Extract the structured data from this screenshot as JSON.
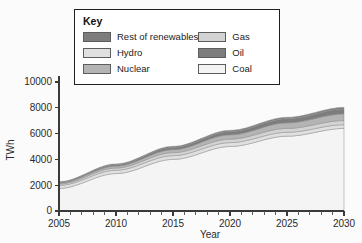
{
  "legend": {
    "title": "Key",
    "left_items": [
      {
        "label": "Rest of renewables",
        "color": "#7d7d7d",
        "swatch_name": "legend-swatch-rest-of-renewables"
      },
      {
        "label": "Hydro",
        "color": "#e0e0e0",
        "swatch_name": "legend-swatch-hydro"
      },
      {
        "label": "Nuclear",
        "color": "#b4b4b4",
        "swatch_name": "legend-swatch-nuclear"
      }
    ],
    "right_items": [
      {
        "label": "Gas",
        "color": "#d3d3d3",
        "swatch_name": "legend-swatch-gas"
      },
      {
        "label": "Oil",
        "color": "#7d7d7d",
        "swatch_name": "legend-swatch-oil"
      },
      {
        "label": "Coal",
        "color": "#f4f4f4",
        "swatch_name": "legend-swatch-coal"
      }
    ]
  },
  "chart_data": {
    "type": "area",
    "title": "",
    "xlabel": "Year",
    "ylabel": "TWh",
    "xlim": [
      2005,
      2030
    ],
    "ylim": [
      0,
      10000
    ],
    "x_ticks": [
      2005,
      2010,
      2015,
      2020,
      2025,
      2030
    ],
    "y_ticks": [
      0,
      2000,
      4000,
      6000,
      8000,
      10000
    ],
    "x_minor_step": 1,
    "grid": false,
    "legend_position": "top-center",
    "stacked": true,
    "x": [
      2005,
      2010,
      2015,
      2020,
      2025,
      2030
    ],
    "series": [
      {
        "name": "Coal",
        "color": "#f4f4f4",
        "values": [
          1750,
          2900,
          4000,
          5000,
          5800,
          6400
        ]
      },
      {
        "name": "Hydro",
        "color": "#e0e0e0",
        "values": [
          230,
          260,
          290,
          300,
          300,
          290
        ]
      },
      {
        "name": "Gas",
        "color": "#d3d3d3",
        "values": [
          110,
          170,
          230,
          270,
          300,
          320
        ]
      },
      {
        "name": "Nuclear",
        "color": "#b4b4b4",
        "values": [
          80,
          150,
          230,
          330,
          430,
          510
        ]
      },
      {
        "name": "Rest of renewables",
        "color": "#7d7d7d",
        "values": [
          60,
          110,
          180,
          250,
          320,
          390
        ]
      },
      {
        "name": "Oil",
        "color": "#7d7d7d",
        "values": [
          40,
          60,
          80,
          100,
          110,
          120
        ]
      }
    ],
    "totals": [
      2270,
      3650,
      5010,
      6250,
      7260,
      8030
    ]
  },
  "y_tick_labels": [
    "10000",
    "8000",
    "6000",
    "4000",
    "2000",
    "0"
  ],
  "x_tick_labels": [
    "2005",
    "2010",
    "2015",
    "2020",
    "2025",
    "2030"
  ]
}
